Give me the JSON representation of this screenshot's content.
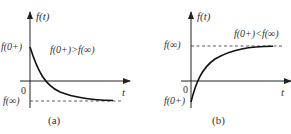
{
  "figure": {
    "panels": [
      {
        "id": "a",
        "caption": "(a)",
        "y_axis_label": "f(t)",
        "x_axis_label": "t",
        "origin_label": "0",
        "initial_label": "f(0+)",
        "final_label": "f(∞)",
        "condition": "f(0+)>f(∞)",
        "curve": "exponential decay from positive f(0+) to negative f(∞)"
      },
      {
        "id": "b",
        "caption": "(b)",
        "y_axis_label": "f(t)",
        "x_axis_label": "t",
        "origin_label": "0",
        "initial_label": "f(0+)",
        "final_label": "f(∞)",
        "condition": "f(0+)<f(∞)",
        "curve": "exponential rise from negative f(0+) to positive f(∞)"
      }
    ]
  }
}
